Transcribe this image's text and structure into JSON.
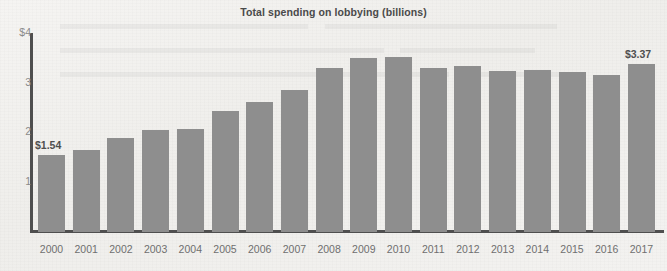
{
  "chart_data": {
    "type": "bar",
    "title": "Total spending on lobbying (billions)",
    "xlabel": "",
    "ylabel": "",
    "ylim": [
      0,
      4
    ],
    "grid": false,
    "legend": null,
    "y_tick_labels": [
      "$4",
      "3",
      "2",
      "1"
    ],
    "y_tick_values": [
      4,
      3,
      2,
      1
    ],
    "categories": [
      "2000",
      "2001",
      "2002",
      "2003",
      "2004",
      "2005",
      "2006",
      "2007",
      "2008",
      "2009",
      "2010",
      "2011",
      "2012",
      "2013",
      "2014",
      "2015",
      "2016",
      "2017"
    ],
    "values": [
      1.54,
      1.64,
      1.89,
      2.04,
      2.07,
      2.42,
      2.61,
      2.85,
      3.29,
      3.49,
      3.51,
      3.29,
      3.33,
      3.23,
      3.25,
      3.22,
      3.15,
      3.37
    ],
    "annotations": [
      {
        "category": "2000",
        "text": "$1.54",
        "value": 1.54
      },
      {
        "category": "2017",
        "text": "$3.37",
        "value": 3.37
      }
    ],
    "bar_color": "#8e8e8e",
    "axis_color": "#4f4f4f",
    "background_color": "#f2f1ef"
  }
}
